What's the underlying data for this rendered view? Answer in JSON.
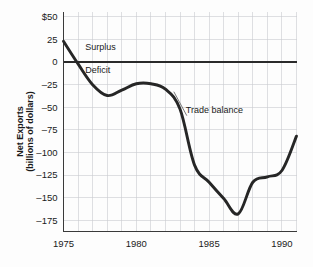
{
  "chart_data": {
    "type": "line",
    "title": "",
    "xlabel": "",
    "ylabel_line1": "Net Exports",
    "ylabel_line2": "(billions of dollars)",
    "xlim": [
      1975,
      1991
    ],
    "ylim": [
      -187.5,
      56
    ],
    "grid": true,
    "legend": "none",
    "x_ticks": [
      "1975",
      "1980",
      "1985",
      "1990"
    ],
    "x_tick_values": [
      1975,
      1980,
      1985,
      1990
    ],
    "y_ticks": [
      "$50",
      "25",
      "0",
      "–25",
      "–50",
      "–75",
      "–100",
      "–125",
      "–150",
      "–175"
    ],
    "y_tick_values": [
      50,
      25,
      0,
      -25,
      -50,
      -75,
      -100,
      -125,
      -150,
      -175
    ],
    "x": [
      1975,
      1976,
      1977,
      1978,
      1979,
      1980,
      1981,
      1982,
      1983,
      1984,
      1985,
      1986,
      1987,
      1988,
      1989,
      1990,
      1991
    ],
    "series": [
      {
        "name": "Trade balance",
        "values": [
          23,
          -2,
          -25,
          -37,
          -31,
          -24,
          -24,
          -30,
          -52,
          -114,
          -133,
          -151,
          -168,
          -133,
          -127,
          -120,
          -82
        ]
      }
    ],
    "annotations": [
      {
        "name": "surplus-label",
        "text": "Surplus",
        "x": 1976.5,
        "y": 13
      },
      {
        "name": "deficit-label",
        "text": "Deficit",
        "x": 1976.5,
        "y": -12
      },
      {
        "name": "trade-balance-label",
        "text": "Trade balance",
        "x": 1983.4,
        "y": -56
      }
    ],
    "colors": {
      "line": "#262626",
      "grid": "#c9ccd1",
      "axis": "#3a3a3a",
      "text": "#1a1a1a",
      "background": "#fdfdfd"
    }
  }
}
